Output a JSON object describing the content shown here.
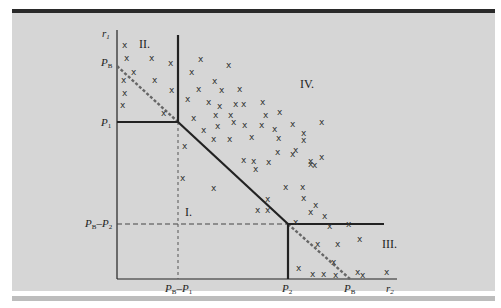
{
  "colors": {
    "background": "#d6d6d6",
    "frame_top": "#2a2a2a",
    "line": "#222222",
    "dashed": "#555555"
  },
  "axes": {
    "y_label": "r",
    "y_label_sub": "1",
    "x_label": "r",
    "x_label_sub": "2"
  },
  "y_ticks": [
    {
      "main": "P",
      "sub": "B",
      "extra": ""
    },
    {
      "main": "P",
      "sub": "1",
      "extra": ""
    },
    {
      "main": "P",
      "sub": "B",
      "dash": "–P",
      "sub2": "2"
    }
  ],
  "x_ticks": [
    {
      "main": "P",
      "sub": "B",
      "dash": "–P",
      "sub2": "1"
    },
    {
      "main": "P",
      "sub": "2"
    },
    {
      "main": "P",
      "sub": "B"
    }
  ],
  "regions": {
    "I": "I.",
    "II": "II.",
    "III": "III.",
    "IV": "IV."
  },
  "marker_symbol": "x"
}
